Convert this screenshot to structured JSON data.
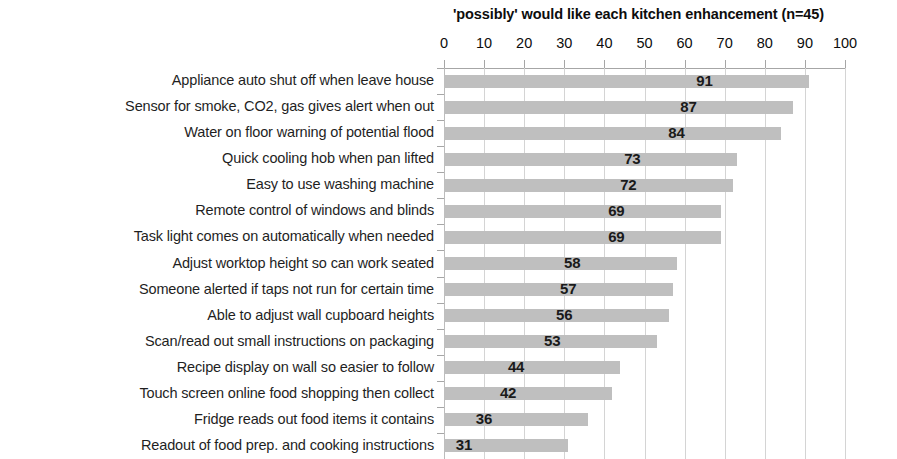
{
  "chart_data": {
    "type": "bar",
    "orientation": "horizontal",
    "title": "'possibly' would like each kitchen enhancement (n=45)",
    "xlabel": "",
    "ylabel": "",
    "xlim": [
      0,
      100
    ],
    "xticks": [
      0,
      10,
      20,
      30,
      40,
      50,
      60,
      70,
      80,
      90,
      100
    ],
    "grid": true,
    "legend": false,
    "bar_color": "#bfbfbf",
    "gridline_color": "#d4d4d4",
    "axis_color": "#a6a6a6",
    "label_color": "#1a1a1a",
    "categories": [
      "Appliance auto shut off when leave house",
      "Sensor for smoke, CO2, gas gives alert when out",
      "Water on floor warning of potential flood",
      "Quick cooling hob when pan lifted",
      "Easy to use washing machine",
      "Remote control of windows and blinds",
      "Task light comes on automatically when needed",
      "Adjust worktop height so can work seated",
      "Someone alerted if taps not run for certain time",
      "Able to adjust wall cupboard heights",
      "Scan/read out small instructions on packaging",
      "Recipe display on wall so easier to follow",
      "Touch screen online food shopping then collect",
      "Fridge reads out food items it contains",
      "Readout of food prep. and cooking instructions"
    ],
    "values": [
      91,
      87,
      84,
      73,
      72,
      69,
      69,
      58,
      57,
      56,
      53,
      44,
      42,
      36,
      31
    ],
    "data_labels": [
      "91",
      "87",
      "84",
      "73",
      "72",
      "69",
      "69",
      "58",
      "57",
      "56",
      "53",
      "44",
      "42",
      "36",
      "31"
    ]
  }
}
